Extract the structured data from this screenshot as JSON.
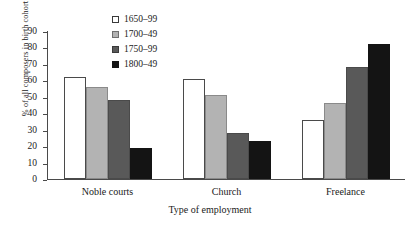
{
  "chart_data": {
    "type": "bar",
    "title": "",
    "xlabel": "Type of employment",
    "ylabel": "% of all composers in birth cohort",
    "categories": [
      "Noble courts",
      "Church",
      "Freelance"
    ],
    "ylim": [
      0,
      90
    ],
    "yticks": [
      0,
      10,
      20,
      30,
      40,
      50,
      60,
      70,
      80,
      90
    ],
    "grid": false,
    "legend_position": "top-center",
    "series": [
      {
        "name": "1650–99",
        "color": "#ffffff",
        "values": [
          62,
          61,
          36
        ]
      },
      {
        "name": "1700–49",
        "color": "#b3b3b3",
        "values": [
          56,
          51,
          46
        ]
      },
      {
        "name": "1750–99",
        "color": "#595959",
        "values": [
          48,
          28,
          68
        ]
      },
      {
        "name": "1800–49",
        "color": "#141414",
        "values": [
          19,
          23,
          82
        ]
      }
    ]
  }
}
